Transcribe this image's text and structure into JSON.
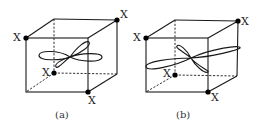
{
  "figure": {
    "panels": [
      {
        "id": "a",
        "caption": "(a)",
        "atom_label": "X",
        "description": "Cube with four X atoms at alternating corners; d-orbital lobes with one lobe horizontal and one tilted"
      },
      {
        "id": "b",
        "caption": "(b)",
        "atom_label": "X",
        "description": "Cube with four X atoms at alternating corners; d-orbital lobes elongated along a diagonal direction"
      }
    ]
  },
  "colors": {
    "line": "#1a1a1a",
    "atom": "#000000",
    "background": "#ffffff"
  }
}
